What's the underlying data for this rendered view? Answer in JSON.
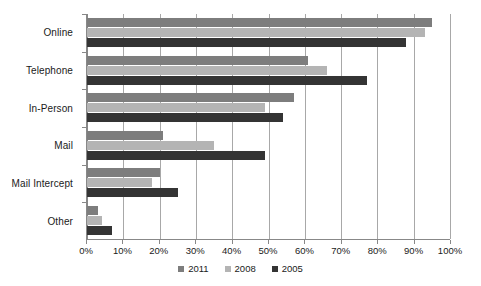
{
  "chart_data": {
    "type": "bar",
    "orientation": "horizontal",
    "title": "",
    "subtitle": "",
    "xlabel": "",
    "ylabel": "",
    "xlim": [
      0,
      100
    ],
    "grid": true,
    "grid_axis": "x",
    "legend_position": "bottom-center",
    "categories": [
      "Online",
      "Telephone",
      "In-Person",
      "Mail",
      "Mail Intercept",
      "Other"
    ],
    "tick_labels": [
      "0%",
      "10%",
      "20%",
      "30%",
      "40%",
      "50%",
      "60%",
      "70%",
      "80%",
      "90%",
      "100%"
    ],
    "tick_values": [
      0,
      10,
      20,
      30,
      40,
      50,
      60,
      70,
      80,
      90,
      100
    ],
    "series": [
      {
        "name": "2011",
        "color": "#7d7d7d",
        "values": [
          95,
          61,
          57,
          21,
          20,
          3
        ]
      },
      {
        "name": "2008",
        "color": "#b4b4b4",
        "values": [
          93,
          66,
          49,
          35,
          18,
          4
        ]
      },
      {
        "name": "2005",
        "color": "#343434",
        "values": [
          88,
          77,
          54,
          49,
          25,
          7
        ]
      }
    ]
  },
  "legend": {
    "items": [
      {
        "label": "2011",
        "color": "#7d7d7d"
      },
      {
        "label": "2008",
        "color": "#b4b4b4"
      },
      {
        "label": "2005",
        "color": "#343434"
      }
    ]
  },
  "axes": {
    "x_axis_color": "#888888",
    "y_axis_color": "#888888",
    "gridline_color": "#a8a8a8"
  }
}
